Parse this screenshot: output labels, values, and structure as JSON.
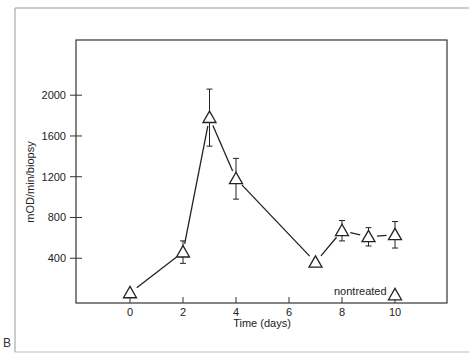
{
  "panel_label": "B",
  "chart_data": {
    "type": "line",
    "title": "",
    "xlabel": "Time (days)",
    "ylabel": "mOD/min/biopsy",
    "xlim": [
      -2,
      12
    ],
    "ylim": [
      0,
      2400
    ],
    "x_ticks": [
      0,
      2,
      4,
      6,
      8,
      10
    ],
    "y_ticks": [
      400,
      800,
      1200,
      1600,
      2000
    ],
    "grid": false,
    "legend": null,
    "series": [
      {
        "name": "treated",
        "marker": "open-triangle",
        "connected": true,
        "x": [
          0,
          2,
          3,
          4,
          7,
          8,
          9,
          10
        ],
        "y": [
          60,
          460,
          1780,
          1180,
          360,
          670,
          610,
          630
        ],
        "error": [
          0,
          110,
          280,
          200,
          0,
          100,
          90,
          130
        ]
      },
      {
        "name": "nontreated",
        "marker": "open-triangle",
        "connected": false,
        "x": [
          10
        ],
        "y": [
          40
        ],
        "error": [
          0
        ]
      }
    ],
    "annotations": [
      {
        "text": "nontreated",
        "x": 8.7,
        "y": 60
      }
    ]
  }
}
